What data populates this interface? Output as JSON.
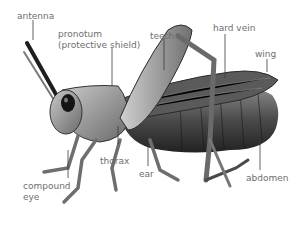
{
  "diagram": {
    "labels": {
      "antenna": "antenna",
      "pronotum_line1": "pronotum",
      "pronotum_line2": "(protective shield)",
      "teeth": "teeth",
      "hard_vein": "hard vein",
      "wing": "wing",
      "thorax": "thorax",
      "ear": "ear",
      "compound_eye_line1": "compound",
      "compound_eye_line2": "eye",
      "abdomen": "abdomen"
    },
    "colors": {
      "label_text": "#6e6e6e",
      "leader_line": "#3a3a3a",
      "body_dark": "#2b2b2b",
      "body_mid": "#6a6a6a",
      "body_light": "#b8b8b8"
    }
  }
}
